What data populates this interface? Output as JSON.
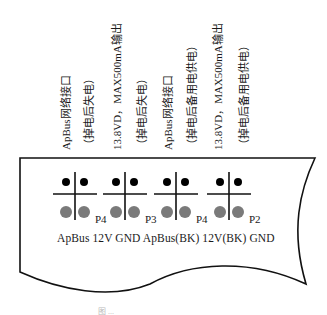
{
  "diagram": {
    "type": "connector-pinout",
    "vertical_labels": [
      {
        "text": "ApBus网络接口",
        "x": 66
      },
      {
        "text": "（掉电后失电）",
        "x": 89
      },
      {
        "text": "13.8VD，MAX500mA输出",
        "x": 117
      },
      {
        "text": "（掉电后失电）",
        "x": 142
      },
      {
        "text": "ApBus网络接口",
        "x": 168
      },
      {
        "text": "（掉电后备用电供电）",
        "x": 192
      },
      {
        "text": "13.8VD，MAX500mA输出",
        "x": 218
      },
      {
        "text": "（掉电后备用电供电）",
        "x": 244
      }
    ],
    "connectors": [
      {
        "id": "P4",
        "x": 63
      },
      {
        "id": "P3",
        "x": 113
      },
      {
        "id": "P4",
        "x": 164
      },
      {
        "id": "P2",
        "x": 217
      }
    ],
    "bottom_labels": "ApBus 12V GND ApBus(BK) 12V(BK) GND",
    "caption": "图 ...",
    "colors": {
      "outline": "#111111",
      "pin_top": "#000000",
      "pin_bottom": "#7a7a7a"
    }
  }
}
